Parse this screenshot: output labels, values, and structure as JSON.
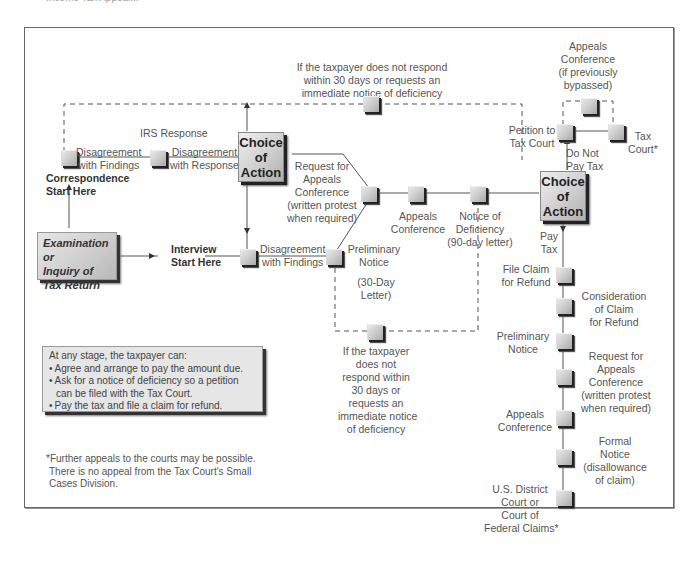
{
  "header": {
    "title_partial": "Income Tax Appeal..."
  },
  "diagram": {
    "top_note": [
      "If the taxpayer does not respond",
      "within 30 days or requests an",
      "immediate notice of deficiency"
    ],
    "bottom_note": [
      "If the taxpayer",
      "does not",
      "respond within",
      "30 days or",
      "requests an",
      "immediate notice",
      "of deficiency"
    ],
    "irs_response": "IRS Response",
    "correspondence": {
      "disagreement_findings": [
        "Disagreement",
        "with Findings"
      ],
      "disagreement_response": [
        "Disagreement",
        "with Response"
      ],
      "start": [
        "Correspondence",
        "Start Here"
      ]
    },
    "exam_box": [
      "Examination or",
      "Inquiry of",
      "Tax Return"
    ],
    "interview": {
      "start": [
        "Interview",
        "Start Here"
      ],
      "disagreement_findings": [
        "Disagreement",
        "with Findings"
      ]
    },
    "choice_of_action": [
      "Choice",
      "of",
      "Action"
    ],
    "request_appeals": [
      "Request for",
      "Appeals",
      "Conference",
      "(written protest",
      "when required)"
    ],
    "preliminary_notice": [
      "Preliminary",
      "Notice"
    ],
    "thirty_day_letter": [
      "(30-Day",
      "Letter)"
    ],
    "appeals_conference": [
      "Appeals",
      "Conference"
    ],
    "notice_of_deficiency": [
      "Notice of",
      "Deficiency",
      "(90-day letter)"
    ],
    "right_branch": {
      "appeals_conf_bypassed": [
        "Appeals",
        "Conference",
        "(if previously",
        "bypassed)"
      ],
      "petition_tax_court": [
        "Petition to",
        "Tax Court"
      ],
      "tax_court": [
        "Tax",
        "Court*"
      ],
      "do_not_pay": [
        "Do Not",
        "Pay Tax"
      ],
      "pay_tax": [
        "Pay",
        "Tax"
      ],
      "file_claim": [
        "File Claim",
        "for Refund"
      ],
      "consideration": [
        "Consideration",
        "of Claim",
        "for Refund"
      ],
      "preliminary_notice": [
        "Preliminary",
        "Notice"
      ],
      "request_appeals": [
        "Request for",
        "Appeals",
        "Conference",
        "(written protest",
        "when required)"
      ],
      "appeals_conference": [
        "Appeals",
        "Conference"
      ],
      "formal_notice": [
        "Formal",
        "Notice",
        "(disallowance",
        "of claim)"
      ],
      "district_court": [
        "U.S. District",
        "Court or",
        "Court of",
        "Federal Claims*"
      ]
    },
    "info_box": {
      "heading": "At any stage, the taxpayer can:",
      "items": [
        "Agree and arrange to pay the amount due.",
        "Ask for a notice of deficiency so a petition can be filed with the Tax Court.",
        "Pay the tax and file a claim for refund."
      ]
    },
    "footnote": [
      "*Further appeals to the courts may be possible.",
      "There is no appeal from the Tax Court's Small",
      "Cases Division."
    ]
  }
}
